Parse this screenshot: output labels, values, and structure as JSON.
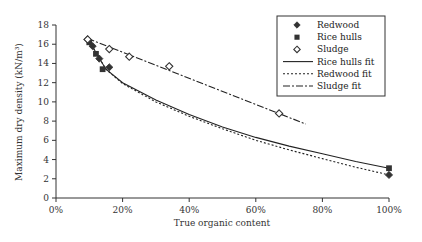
{
  "chart_data": {
    "type": "scatter",
    "title": "",
    "xlabel": "True organic content",
    "ylabel": "Maximum dry density (kN/m³)",
    "xlim": [
      0,
      100
    ],
    "ylim": [
      0,
      18
    ],
    "x_ticks": [
      "0%",
      "20%",
      "40%",
      "60%",
      "80%",
      "100%"
    ],
    "y_ticks": [
      "0",
      "2",
      "4",
      "6",
      "8",
      "10",
      "12",
      "14",
      "16",
      "18"
    ],
    "grid": false,
    "legend_position": "upper right",
    "series": [
      {
        "name": "Redwood",
        "kind": "points",
        "marker": "filled-diamond",
        "x": [
          9.5,
          11,
          13,
          16,
          100
        ],
        "y": [
          16.5,
          15.8,
          14.5,
          13.6,
          2.4
        ]
      },
      {
        "name": "Rice hulls",
        "kind": "points",
        "marker": "filled-square",
        "x": [
          10,
          12,
          14,
          100
        ],
        "y": [
          16.2,
          15.0,
          13.4,
          3.1
        ]
      },
      {
        "name": "Sludge",
        "kind": "points",
        "marker": "open-diamond",
        "x": [
          9.5,
          16,
          22,
          34,
          67
        ],
        "y": [
          16.5,
          15.5,
          14.7,
          13.7,
          8.8
        ]
      },
      {
        "name": "Rice hulls fit",
        "kind": "line",
        "style": "solid",
        "x": [
          10,
          15,
          20,
          30,
          40,
          50,
          60,
          70,
          80,
          90,
          100
        ],
        "y": [
          16.3,
          13.4,
          12.0,
          10.2,
          8.7,
          7.4,
          6.3,
          5.4,
          4.6,
          3.8,
          3.1
        ]
      },
      {
        "name": "Redwood fit",
        "kind": "line",
        "style": "dotted",
        "x": [
          10,
          15,
          20,
          30,
          40,
          50,
          60,
          70,
          80,
          90,
          100
        ],
        "y": [
          16.3,
          13.4,
          11.9,
          10.0,
          8.5,
          7.2,
          6.0,
          5.0,
          4.1,
          3.2,
          2.4
        ]
      },
      {
        "name": "Sludge fit",
        "kind": "line",
        "style": "dash-dot",
        "x": [
          9.5,
          75
        ],
        "y": [
          16.6,
          7.7
        ]
      }
    ]
  },
  "legend": {
    "items": [
      {
        "label": "Redwood"
      },
      {
        "label": "Rice hulls"
      },
      {
        "label": "Sludge"
      },
      {
        "label": "Rice hulls fit"
      },
      {
        "label": "Redwood fit"
      },
      {
        "label": "Sludge fit"
      }
    ]
  },
  "axes": {
    "xlabel": "True organic content",
    "ylabel": "Maximum dry density (kN/m³)"
  }
}
